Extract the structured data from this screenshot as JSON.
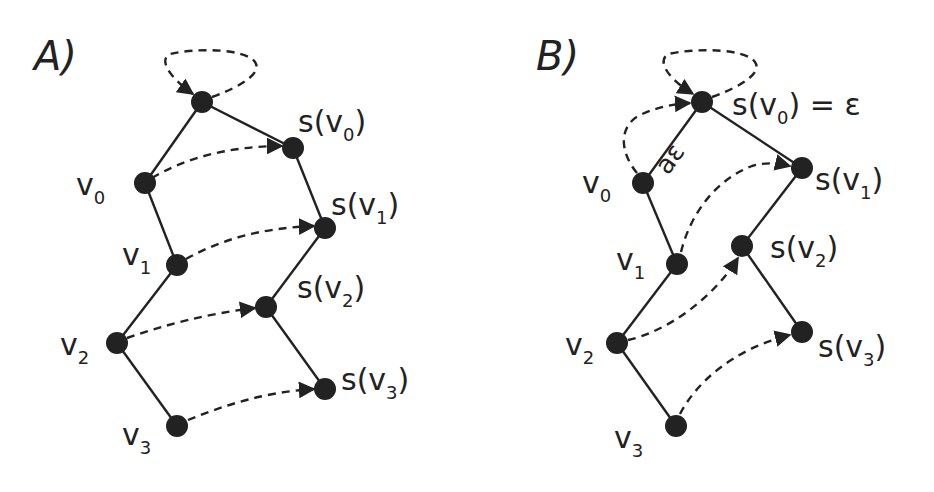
{
  "panels": [
    {
      "id": "A",
      "label": "A)",
      "nodes": [
        {
          "id": "top",
          "label": "",
          "x": 202,
          "y": 102
        },
        {
          "id": "v0",
          "label": "v",
          "sub": "0",
          "x": 145,
          "y": 183
        },
        {
          "id": "v1",
          "label": "v",
          "sub": "1",
          "x": 177,
          "y": 265
        },
        {
          "id": "v2",
          "label": "v",
          "sub": "2",
          "x": 117,
          "y": 343
        },
        {
          "id": "v3",
          "label": "v",
          "sub": "3",
          "x": 177,
          "y": 426
        },
        {
          "id": "sv0",
          "label": "s(v",
          "sub": "0",
          "close": ")",
          "x": 293,
          "y": 148
        },
        {
          "id": "sv1",
          "label": "s(v",
          "sub": "1",
          "close": ")",
          "x": 325,
          "y": 228
        },
        {
          "id": "sv2",
          "label": "s(v",
          "sub": "2",
          "close": ")",
          "x": 266,
          "y": 307
        },
        {
          "id": "sv3",
          "label": "s(v",
          "sub": "3",
          "close": ")",
          "x": 325,
          "y": 389
        }
      ],
      "solid_edges": [
        [
          "top",
          "v0"
        ],
        [
          "v0",
          "v1"
        ],
        [
          "v1",
          "v2"
        ],
        [
          "v2",
          "v3"
        ],
        [
          "top",
          "sv0"
        ],
        [
          "sv0",
          "sv1"
        ],
        [
          "sv1",
          "sv2"
        ],
        [
          "sv2",
          "sv3"
        ]
      ],
      "dashed_arrows": [
        [
          "top",
          "top"
        ],
        [
          "v0",
          "sv0"
        ],
        [
          "v1",
          "sv1"
        ],
        [
          "v2",
          "sv2"
        ],
        [
          "v3",
          "sv3"
        ]
      ]
    },
    {
      "id": "B",
      "label": "B)",
      "nodes": [
        {
          "id": "top",
          "label": "s(v",
          "sub": "0",
          "close": ") = ε",
          "x": 702,
          "y": 102
        },
        {
          "id": "v0",
          "label": "v",
          "sub": "0",
          "x": 643,
          "y": 183
        },
        {
          "id": "v1",
          "label": "v",
          "sub": "1",
          "x": 677,
          "y": 264
        },
        {
          "id": "v2",
          "label": "v",
          "sub": "2",
          "x": 617,
          "y": 343
        },
        {
          "id": "v3",
          "label": "v",
          "sub": "3",
          "x": 676,
          "y": 426
        },
        {
          "id": "sv1",
          "label": "s(v",
          "sub": "1",
          "close": ")",
          "x": 802,
          "y": 168
        },
        {
          "id": "sv2",
          "label": "s(v",
          "sub": "2",
          "close": ")",
          "x": 742,
          "y": 246
        },
        {
          "id": "sv3",
          "label": "s(v",
          "sub": "3",
          "close": ")",
          "x": 802,
          "y": 332
        }
      ],
      "edge_label": "aε",
      "solid_edges": [
        [
          "top",
          "v0"
        ],
        [
          "v0",
          "v1"
        ],
        [
          "v1",
          "v2"
        ],
        [
          "v2",
          "v3"
        ],
        [
          "top",
          "sv1"
        ],
        [
          "sv1",
          "sv2"
        ],
        [
          "sv2",
          "sv3"
        ]
      ],
      "dashed_arrows": [
        [
          "top",
          "top"
        ],
        [
          "v0",
          "top"
        ],
        [
          "v1",
          "sv1"
        ],
        [
          "v2",
          "sv2"
        ],
        [
          "v3",
          "sv3"
        ]
      ]
    }
  ],
  "labels": {
    "A": {
      "title": "A)",
      "v": "v",
      "s": "s(v",
      "close": ")"
    },
    "B": {
      "title": "B)",
      "eq": ") = ε",
      "edge": "aε"
    },
    "subs": {
      "0": "0",
      "1": "1",
      "2": "2",
      "3": "3"
    }
  }
}
